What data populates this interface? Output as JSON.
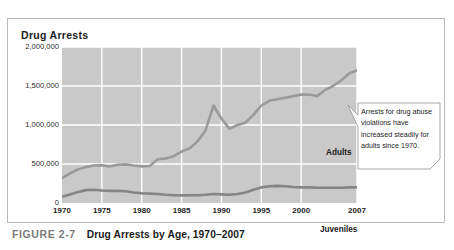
{
  "figure": {
    "caption_label": "FIGURE 2-7",
    "caption_text": "Drug Arrests by Age, 1970–2007"
  },
  "callout": {
    "text": "Arrests for drug abuse violations have increased steadily for adults since 1970."
  },
  "colors": {
    "plot_background": "#c9c9c9",
    "gridline": "#ffffff",
    "adults_line": "#9a9a9a",
    "juveniles_line": "#858585",
    "frame_border": "#b9b9b9",
    "title_text": "#1a1a1a",
    "caption_label_text": "#7a7a7a"
  },
  "chart_data": {
    "type": "line",
    "title": "Drug Arrests",
    "xlabel": "",
    "ylabel": "Drug Arrests",
    "xlim": [
      1970,
      2007
    ],
    "ylim": [
      0,
      2000000
    ],
    "grid": true,
    "legend_position": "inline-labels",
    "ytick_labels": [
      "2,000,000",
      "1,500,000",
      "1,000,000",
      "500,000",
      "0"
    ],
    "ytick_values": [
      2000000,
      1500000,
      1000000,
      500000,
      0
    ],
    "xtick_labels": [
      "1970",
      "1975",
      "1980",
      "1985",
      "1990",
      "1995",
      "2000",
      "2007"
    ],
    "xtick_values": [
      1970,
      1975,
      1980,
      1985,
      1990,
      1995,
      2000,
      2007
    ],
    "x": [
      1970,
      1971,
      1972,
      1973,
      1974,
      1975,
      1976,
      1977,
      1978,
      1979,
      1980,
      1981,
      1982,
      1983,
      1984,
      1985,
      1986,
      1987,
      1988,
      1989,
      1990,
      1991,
      1992,
      1993,
      1994,
      1995,
      1996,
      1997,
      1998,
      1999,
      2000,
      2001,
      2002,
      2003,
      2004,
      2005,
      2006,
      2007
    ],
    "series": [
      {
        "name": "Adults",
        "color": "#9a9a9a",
        "values": [
          320000,
          380000,
          430000,
          460000,
          480000,
          485000,
          470000,
          490000,
          495000,
          480000,
          470000,
          475000,
          560000,
          570000,
          600000,
          660000,
          700000,
          790000,
          930000,
          1250000,
          1080000,
          950000,
          1000000,
          1030000,
          1130000,
          1250000,
          1310000,
          1330000,
          1350000,
          1370000,
          1390000,
          1390000,
          1370000,
          1450000,
          1500000,
          1570000,
          1660000,
          1700000
        ],
        "annotations": [
          {
            "label": "Adults",
            "x": 1996,
            "y": 1180000
          }
        ]
      },
      {
        "name": "Juveniles",
        "color": "#858585",
        "values": [
          80000,
          110000,
          140000,
          165000,
          170000,
          160000,
          155000,
          155000,
          150000,
          135000,
          125000,
          120000,
          115000,
          105000,
          100000,
          98000,
          100000,
          100000,
          105000,
          115000,
          110000,
          105000,
          115000,
          135000,
          170000,
          200000,
          215000,
          220000,
          215000,
          205000,
          200000,
          200000,
          195000,
          195000,
          195000,
          195000,
          200000,
          200000
        ],
        "annotations": [
          {
            "label": "Juveniles",
            "x": 1995,
            "y": 320000
          }
        ]
      }
    ]
  }
}
